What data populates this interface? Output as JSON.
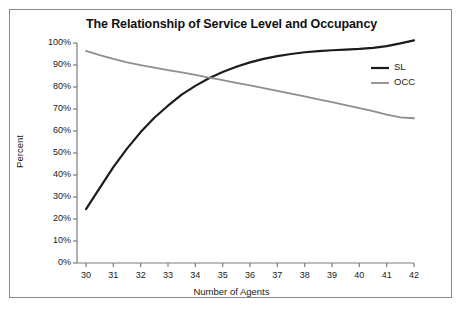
{
  "chart_data": {
    "type": "line",
    "title": "The Relationship of Service Level and Occupancy",
    "xlabel": "Number of Agents",
    "ylabel": "Percent",
    "xlim": [
      30,
      42
    ],
    "ylim": [
      0,
      1.0
    ],
    "grid": false,
    "legend_position": "right",
    "x_tick_labels": [
      "30",
      "31",
      "32",
      "33",
      "34",
      "35",
      "36",
      "37",
      "38",
      "39",
      "40",
      "41",
      "42"
    ],
    "y_tick_labels": [
      "0%",
      "10%",
      "20%",
      "30%",
      "40%",
      "50%",
      "60%",
      "70%",
      "80%",
      "90%",
      "100%"
    ],
    "x": [
      30,
      30.5,
      31,
      31.5,
      32,
      32.5,
      33,
      33.5,
      34,
      34.5,
      35,
      35.5,
      36,
      36.5,
      37,
      37.5,
      38,
      38.5,
      39,
      39.5,
      40,
      40.5,
      41,
      41.5,
      42
    ],
    "series": [
      {
        "name": "SL",
        "color": "#1c1c1c",
        "width": 2.2,
        "values": [
          24.5,
          34,
          43.6,
          52,
          59.5,
          66,
          71.5,
          76.5,
          80.5,
          84,
          86.8,
          89.2,
          91.2,
          92.8,
          94.0,
          95.0,
          95.8,
          96.3,
          96.7,
          97.0,
          97.3,
          97.8,
          98.6,
          99.8,
          101.2
        ]
      },
      {
        "name": "OCC",
        "color": "#8e8e8e",
        "width": 1.8,
        "values": [
          96.4,
          94.5,
          92.8,
          91.2,
          89.9,
          88.8,
          87.7,
          86.6,
          85.5,
          84.3,
          83.1,
          81.9,
          80.7,
          79.5,
          78.2,
          77.0,
          75.7,
          74.4,
          73.1,
          71.8,
          70.4,
          69.0,
          67.4,
          66.2,
          65.8
        ]
      }
    ],
    "legend": [
      {
        "label": "SL",
        "color": "#1c1c1c"
      },
      {
        "label": "OCC",
        "color": "#8e8e8e"
      }
    ]
  }
}
